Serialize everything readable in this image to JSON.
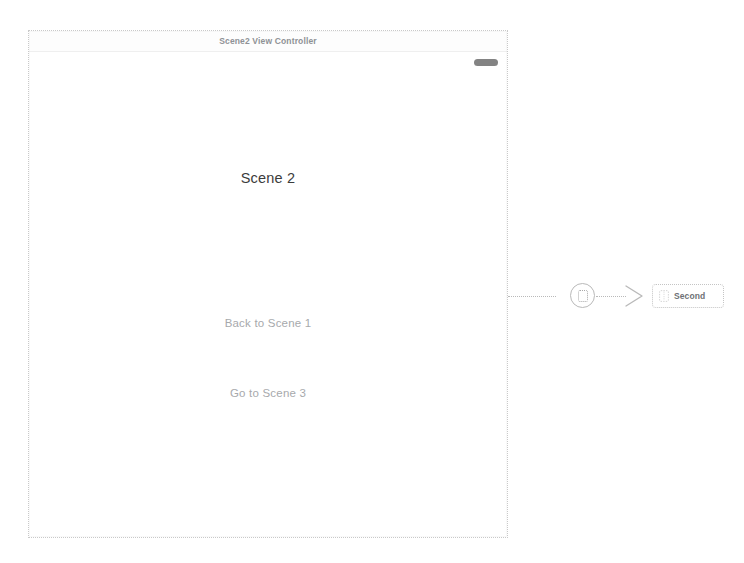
{
  "storyboard": {
    "scene": {
      "title_bar": {
        "title": "Scene2 View Controller"
      },
      "handle_icon": "home-indicator-pill",
      "content": {
        "heading": "Scene 2",
        "buttons": [
          {
            "label": "Back to Scene 1"
          },
          {
            "label": "Go to Scene 3"
          }
        ]
      }
    },
    "segue": {
      "badge_icon": "segue-action-icon",
      "arrow_icon": "chevron-right-icon",
      "destination": {
        "icon": "view-controller-icon",
        "label": "Second"
      }
    },
    "colors": {
      "canvas_border": "#c9c9c9",
      "title_text": "#8f9296",
      "heading_text": "#3c3c3c",
      "button_text": "#a7a9ac",
      "connection_line": "#b9b9b9",
      "handle_pill": "#6d6d6d"
    }
  }
}
